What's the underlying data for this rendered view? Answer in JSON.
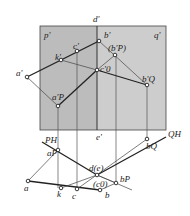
{
  "figure": {
    "type": "descriptive-geometry-projection",
    "colors": {
      "plane_p": "#bdbdbd",
      "plane_q": "#cccccc",
      "line": "#222222",
      "thin": "#555555",
      "background": "#ffffff"
    }
  },
  "labels": {
    "d_prime": "d'",
    "p_prime": "p'",
    "q_prime": "q'",
    "a_prime": "a'",
    "k_prime": "k'",
    "c_prime": "c'",
    "b_prime": "b'",
    "bP_prime": "(b'P)",
    "c0_prime": "c'0",
    "bQ_prime": "b'Q",
    "aP_prime": "a'P",
    "e_prime": "e'",
    "PH": "PH",
    "QH": "QH",
    "aP": "aP",
    "bQ": "bQ",
    "de": "d(e)",
    "c0": "(c0)",
    "bP": "bP",
    "a": "a",
    "k": "k",
    "c": "c",
    "b": "b"
  }
}
